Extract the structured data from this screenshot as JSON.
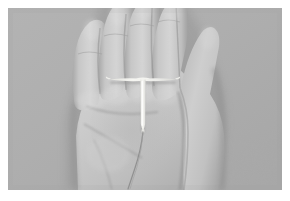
{
  "media": {
    "type": "photograph",
    "subject": "open human palm holding a T-shaped intrauterine device (IUD)",
    "orientation": "landscape",
    "color_mode": "grayscale",
    "alt_text": "A grayscale photo of an open left palm, fingers pointing upward, with a small white T-shaped IUD resting in the center of the palm and its thin monofilament threads trailing downward.",
    "frame": {
      "border_color": "#ffffff",
      "border_width_px": 8,
      "photo_width_px": 274,
      "photo_height_px": 182
    }
  },
  "scene": {
    "background": {
      "name": "studio-backdrop",
      "color": "#adadad",
      "description": "flat neutral gray studio backdrop"
    },
    "hand": {
      "name": "open-palm",
      "side": "left",
      "pose": "open palm facing camera, fingers extended upward, thumb folded toward the right",
      "skin_tone_light": "#d2d2d2",
      "skin_tone_mid": "#bdbdbd",
      "skin_tone_shadow": "#9b9b9b",
      "fingers": [
        {
          "name": "pinky-finger",
          "position": "far-left"
        },
        {
          "name": "ring-finger",
          "position": "left-center"
        },
        {
          "name": "middle-finger",
          "position": "center"
        },
        {
          "name": "index-finger",
          "position": "right-center"
        },
        {
          "name": "thumb",
          "position": "right, bent inward"
        }
      ]
    },
    "device": {
      "name": "iud-device",
      "label": "T-shaped intrauterine device",
      "color": "#f2f2ee",
      "shape": "T-frame with vertical stem and two horizontal arms",
      "thread": {
        "name": "iud-thread",
        "label": "monofilament retrieval threads",
        "color": "#8f8f8f",
        "description": "thin threads extending downward from the base of the stem"
      },
      "approx_position": {
        "crossbar_center_x": 136,
        "crossbar_y": 78,
        "crossbar_width": 34,
        "stem_bottom_y": 124
      }
    }
  }
}
